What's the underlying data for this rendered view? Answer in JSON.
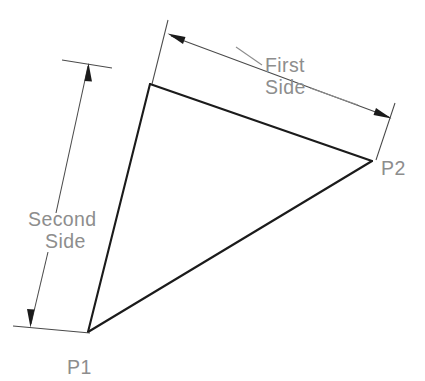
{
  "diagram": {
    "type": "technical-dimension-drawing",
    "background_color": "#ffffff",
    "shape_line_color": "#1b1b1b",
    "dimension_line_color": "#4a4a4a",
    "text_color": "#8d8d8d",
    "labels": {
      "first_side_line1": "First",
      "first_side_line2": "Side",
      "second_side_line1": "Second",
      "second_side_line2": "Side",
      "point_1": "P1",
      "point_2": "P2"
    },
    "vertices": [
      {
        "name": "P1",
        "label": "P1",
        "x": 88,
        "y": 332
      },
      {
        "name": "P2",
        "label": "P2",
        "x": 372,
        "y": 161
      },
      {
        "name": "apex",
        "label": "",
        "x": 150,
        "y": 84
      }
    ],
    "dimensions": [
      {
        "name": "first-side",
        "label": "First Side",
        "from_vertex": "apex",
        "to_vertex": "P2",
        "arrow_start": {
          "x": 169,
          "y": 35
        },
        "arrow_end": {
          "x": 390,
          "y": 117
        },
        "extension_start": {
          "x": 167,
          "y": 22
        },
        "extension_end": {
          "x": 394,
          "y": 105
        }
      },
      {
        "name": "second-side",
        "label": "Second Side",
        "from_vertex": "apex",
        "to_vertex": "P1",
        "arrow_start": {
          "x": 88,
          "y": 65
        },
        "arrow_end": {
          "x": 31,
          "y": 325
        },
        "extension_start": {
          "x": 63,
          "y": 61
        },
        "extension_end": {
          "x": 14,
          "y": 321
        }
      }
    ]
  }
}
